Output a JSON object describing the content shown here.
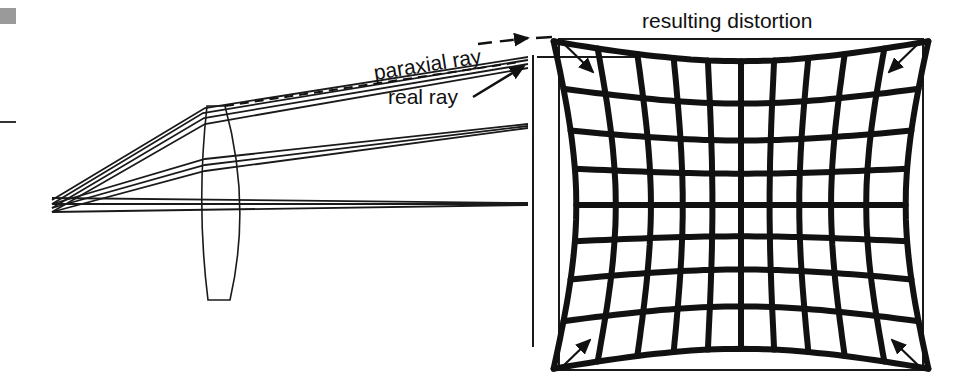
{
  "figure": {
    "title": "resulting distortion",
    "labels": {
      "paraxial_ray": "paraxial ray",
      "real_ray": "real ray"
    },
    "distortion_type": "pincushion",
    "grid": {
      "vertical_lines": 11,
      "horizontal_lines": 9,
      "columns": 10,
      "rows": 8
    },
    "colors": {
      "ink": "#111111",
      "background": "#ffffff",
      "corner_mark": "#9a9a9a"
    }
  }
}
